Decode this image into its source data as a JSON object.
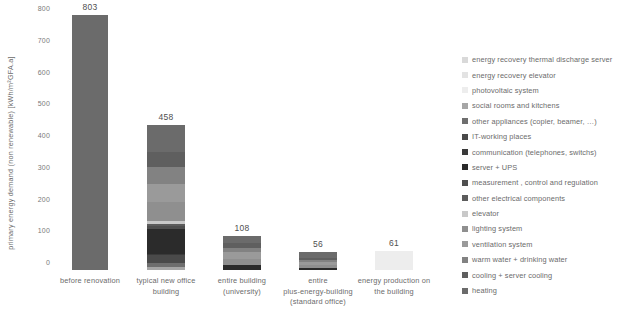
{
  "chart_data": {
    "type": "bar",
    "subtype": "stacked-bar",
    "title": "",
    "xlabel": "",
    "ylabel": "primary energy demand (non renewable) [kWh/m²GFA.a]",
    "ylim": [
      0,
      800
    ],
    "yticks": [
      0,
      100,
      200,
      300,
      400,
      500,
      600,
      700,
      800
    ],
    "ytick_labels": [
      "0",
      "100",
      "200",
      "300",
      "400",
      "500",
      "600",
      "700",
      "800"
    ],
    "grid": false,
    "legend_position": "right",
    "categories": [
      "before renovation",
      "typical new office building",
      "entire building (university)",
      "entire plus-energy-building (standard office)",
      "energy production on the building"
    ],
    "totals": [
      803,
      458,
      108,
      56,
      61
    ],
    "total_labels": [
      "803",
      "458",
      "108",
      "56",
      "61"
    ],
    "series": [
      {
        "name": "energy recovery thermal discharge server",
        "color": "#d9d9d9",
        "values": [
          0,
          0,
          0,
          0,
          0
        ]
      },
      {
        "name": "energy recovery elevator",
        "color": "#e3e3e3",
        "values": [
          0,
          0,
          0,
          0,
          0
        ]
      },
      {
        "name": "photovoltaic system",
        "color": "#ededed",
        "values": [
          0,
          0,
          0,
          0,
          61
        ]
      },
      {
        "name": "social rooms and kitchens",
        "color": "#a6a6a6",
        "values": [
          0,
          9,
          0,
          0,
          0
        ]
      },
      {
        "name": "other appliances (copier, beamer, …)",
        "color": "#6e6e6e",
        "values": [
          0,
          14,
          0,
          0,
          0
        ]
      },
      {
        "name": "IT-working places",
        "color": "#4a4a4a",
        "values": [
          0,
          23,
          0,
          0,
          0
        ]
      },
      {
        "name": "communication (telephones, switchs)",
        "color": "#3a3a3a",
        "values": [
          0,
          6,
          0,
          0,
          0
        ]
      },
      {
        "name": "server + UPS",
        "color": "#2b2b2b",
        "values": [
          0,
          78,
          16,
          7,
          0
        ]
      },
      {
        "name": "measurement , control and regulation",
        "color": "#4f4f4f",
        "values": [
          0,
          8,
          0,
          0,
          0
        ]
      },
      {
        "name": "other electrical components",
        "color": "#5c5c5c",
        "values": [
          0,
          6,
          0,
          0,
          0
        ]
      },
      {
        "name": "elevator",
        "color": "#c9c9c9",
        "values": [
          0,
          10,
          0,
          0,
          0
        ]
      },
      {
        "name": "lighting system",
        "color": "#8f8f8f",
        "values": [
          0,
          62,
          20,
          9,
          0
        ]
      },
      {
        "name": "ventilation system",
        "color": "#9a9a9a",
        "values": [
          0,
          56,
          22,
          10,
          0
        ]
      },
      {
        "name": "warm water + drinking water",
        "color": "#828282",
        "values": [
          0,
          54,
          12,
          6,
          0
        ]
      },
      {
        "name": "cooling + server cooling",
        "color": "#5f5f5f",
        "values": [
          0,
          46,
          14,
          7,
          0
        ]
      },
      {
        "name": "heating",
        "color": "#6b6b6b",
        "values": [
          803,
          86,
          24,
          17,
          0
        ]
      }
    ]
  },
  "legend": {
    "items": [
      {
        "label": "energy recovery thermal discharge server",
        "color": "#d9d9d9"
      },
      {
        "label": "energy recovery elevator",
        "color": "#e3e3e3"
      },
      {
        "label": "photovoltaic system",
        "color": "#ededed"
      },
      {
        "label": "social rooms and kitchens",
        "color": "#a6a6a6"
      },
      {
        "label": "other appliances (copier, beamer, …)",
        "color": "#6e6e6e"
      },
      {
        "label": "IT-working places",
        "color": "#4a4a4a"
      },
      {
        "label": "communication (telephones, switchs)",
        "color": "#3a3a3a"
      },
      {
        "label": "server + UPS",
        "color": "#2b2b2b"
      },
      {
        "label": "measurement , control and regulation",
        "color": "#4f4f4f"
      },
      {
        "label": "other electrical components",
        "color": "#5c5c5c"
      },
      {
        "label": "elevator",
        "color": "#c9c9c9"
      },
      {
        "label": "lighting system",
        "color": "#8f8f8f"
      },
      {
        "label": "ventilation system",
        "color": "#9a9a9a"
      },
      {
        "label": "warm water + drinking water",
        "color": "#828282"
      },
      {
        "label": "cooling + server cooling",
        "color": "#5f5f5f"
      },
      {
        "label": "heating",
        "color": "#6b6b6b"
      }
    ]
  },
  "axis": {
    "y_title": "primary energy demand (non renewable) [kWh/m²GFA.a]",
    "y_tick_labels": [
      "800",
      "700",
      "600",
      "500",
      "400",
      "300",
      "200",
      "100",
      "0"
    ]
  },
  "x_axis": {
    "labels": [
      [
        "before renovation"
      ],
      [
        "typical new office",
        "building"
      ],
      [
        "entire building",
        "(university)"
      ],
      [
        "entire",
        "plus-energy-building",
        "(standard office)"
      ],
      [
        "energy production on",
        "the building"
      ]
    ]
  }
}
